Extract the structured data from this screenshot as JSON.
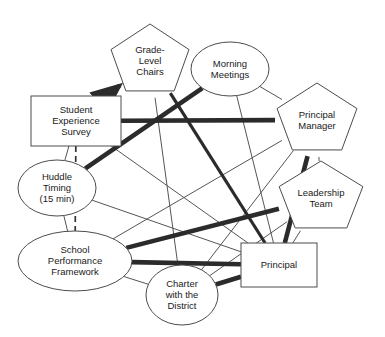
{
  "diagram": {
    "canvas": {
      "width": 385,
      "height": 337
    },
    "colors": {
      "background": "#ffffff",
      "node_stroke": "#4c4c4c",
      "node_fill": "#ffffff",
      "label": "#1a1a1a",
      "edge_thin": "#555555",
      "edge_thick": "#2b2b2b",
      "edge_dashed": "#333333"
    },
    "nodes": [
      {
        "id": "grade_level_chairs",
        "label": "Grade-Level Chairs",
        "lines": [
          "Grade-",
          "Level",
          "Chairs"
        ],
        "shape": "pentagon",
        "cx": 150,
        "cy": 61,
        "rx": 41,
        "ry": 37
      },
      {
        "id": "morning_meetings",
        "label": "Morning Meetings",
        "lines": [
          "Morning",
          "Meetings"
        ],
        "shape": "ellipse",
        "cx": 230,
        "cy": 69,
        "rx": 39,
        "ry": 27
      },
      {
        "id": "principal_manager",
        "label": "Principal Manager",
        "lines": [
          "Principal",
          "Manager"
        ],
        "shape": "pentagon",
        "cx": 317,
        "cy": 120,
        "rx": 42,
        "ry": 37
      },
      {
        "id": "leadership_team",
        "label": "Leadership Team",
        "lines": [
          "Leadership",
          "Team"
        ],
        "shape": "pentagon",
        "cx": 321,
        "cy": 198,
        "rx": 44,
        "ry": 37
      },
      {
        "id": "principal",
        "label": "Principal",
        "lines": [
          "Principal"
        ],
        "shape": "rect",
        "cx": 279,
        "cy": 265,
        "rx": 38,
        "ry": 22
      },
      {
        "id": "charter_with_district",
        "label": "Charter with the District",
        "lines": [
          "Charter",
          "with the",
          "District"
        ],
        "shape": "ellipse",
        "cx": 182,
        "cy": 295,
        "rx": 36,
        "ry": 30
      },
      {
        "id": "school_performance_framework",
        "label": "School Performance Framework",
        "lines": [
          "School",
          "Performance",
          "Framework"
        ],
        "shape": "ellipse",
        "cx": 75,
        "cy": 261,
        "rx": 57,
        "ry": 30
      },
      {
        "id": "huddle_timing",
        "label": "Huddle Timing (15 min)",
        "lines": [
          "Huddle",
          "Timing",
          "(15 min)"
        ],
        "shape": "ellipse",
        "cx": 57,
        "cy": 188,
        "rx": 39,
        "ry": 28
      },
      {
        "id": "student_experience_survey",
        "label": "Student Experience Survey",
        "lines": [
          "Student",
          "Experience",
          "Survey"
        ],
        "shape": "rect",
        "cx": 76,
        "cy": 121,
        "rx": 45,
        "ry": 25
      }
    ],
    "edges": [
      {
        "id": "e1",
        "from": "grade_level_chairs",
        "to": "morning_meetings",
        "weight": "thin",
        "style": "solid"
      },
      {
        "id": "e2",
        "from": "morning_meetings",
        "to": "principal_manager",
        "weight": "thin",
        "style": "solid"
      },
      {
        "id": "e3",
        "from": "principal_manager",
        "to": "leadership_team",
        "weight": "thin",
        "style": "solid"
      },
      {
        "id": "e4",
        "from": "leadership_team",
        "to": "principal",
        "weight": "thin",
        "style": "solid"
      },
      {
        "id": "e5",
        "from": "charter_with_district",
        "to": "school_performance_framework",
        "weight": "thin",
        "style": "solid"
      },
      {
        "id": "e6",
        "from": "school_performance_framework",
        "to": "huddle_timing",
        "weight": "thin",
        "style": "solid"
      },
      {
        "id": "e7",
        "from": "huddle_timing",
        "to": "student_experience_survey",
        "weight": "thin",
        "style": "solid"
      },
      {
        "id": "e8",
        "from": "student_experience_survey",
        "to": "grade_level_chairs",
        "weight": "thick",
        "style": "solid",
        "arrow": true
      },
      {
        "id": "e9",
        "from": "student_experience_survey",
        "to": "school_performance_framework",
        "weight": "dashed",
        "style": "dashed"
      },
      {
        "id": "e10",
        "from": "grade_level_chairs",
        "to": "principal",
        "weight": "thin",
        "style": "solid"
      },
      {
        "id": "e11",
        "from": "grade_level_chairs",
        "to": "charter_with_district",
        "weight": "thin",
        "style": "solid"
      },
      {
        "id": "e12",
        "from": "morning_meetings",
        "to": "huddle_timing",
        "weight": "thick",
        "style": "solid"
      },
      {
        "id": "e13",
        "from": "morning_meetings",
        "to": "principal",
        "weight": "thin",
        "style": "solid"
      },
      {
        "id": "e14",
        "from": "principal_manager",
        "to": "student_experience_survey",
        "weight": "thick",
        "style": "solid"
      },
      {
        "id": "e15",
        "from": "principal_manager",
        "to": "principal",
        "weight": "thick",
        "style": "solid"
      },
      {
        "id": "e16",
        "from": "principal_manager",
        "to": "school_performance_framework",
        "weight": "thin",
        "style": "solid"
      },
      {
        "id": "e17",
        "from": "leadership_team",
        "to": "school_performance_framework",
        "weight": "thick",
        "style": "solid"
      },
      {
        "id": "e18",
        "from": "leadership_team",
        "to": "charter_with_district",
        "weight": "thin",
        "style": "solid"
      },
      {
        "id": "e19",
        "from": "principal",
        "to": "school_performance_framework",
        "weight": "thick",
        "style": "solid"
      },
      {
        "id": "e20",
        "from": "principal",
        "to": "huddle_timing",
        "weight": "thin",
        "style": "solid"
      },
      {
        "id": "e21",
        "from": "principal",
        "to": "charter_with_district",
        "weight": "thick",
        "style": "solid"
      },
      {
        "id": "e22",
        "from": "principal",
        "to": "student_experience_survey",
        "weight": "thin",
        "style": "solid"
      },
      {
        "id": "e23",
        "from": "principal",
        "to": "grade_level_chairs",
        "weight": "medium",
        "style": "solid"
      },
      {
        "id": "e24",
        "from": "charter_with_district",
        "to": "principal_manager",
        "weight": "thin",
        "style": "solid"
      }
    ]
  }
}
